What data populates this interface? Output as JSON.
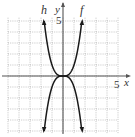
{
  "chart_data": {
    "type": "line",
    "title": "",
    "xlabel": "x",
    "ylabel": "y",
    "xlim": [
      -5,
      5
    ],
    "ylim": [
      -5,
      5
    ],
    "grid": true,
    "tick_labels": {
      "x": [
        "5"
      ],
      "y": [
        "5"
      ]
    },
    "series": [
      {
        "name": "f",
        "expression": "x^3",
        "x": [
          -1.71,
          -1.5,
          -1,
          -0.5,
          0,
          0.5,
          1,
          1.5,
          1.71
        ],
        "values": [
          -5,
          -3.375,
          -1,
          -0.125,
          0,
          0.125,
          1,
          3.375,
          5
        ]
      },
      {
        "name": "h",
        "expression": "-x^3",
        "x": [
          -1.71,
          -1.5,
          -1,
          -0.5,
          0,
          0.5,
          1,
          1.5,
          1.71
        ],
        "values": [
          5,
          3.375,
          1,
          0.125,
          0,
          -0.125,
          -1,
          -3.375,
          -5
        ]
      }
    ]
  },
  "labels": {
    "x_axis": "x",
    "y_axis": "y",
    "x_tick": "5",
    "y_tick": "5",
    "curve_f": "f",
    "curve_h": "h"
  },
  "colors": {
    "grid": "#9a9a9a",
    "axis": "#555555",
    "curve": "#1a1a1a"
  }
}
